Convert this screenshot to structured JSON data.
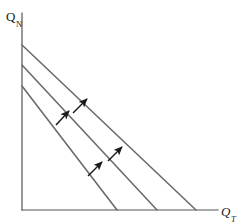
{
  "figure": {
    "title": "",
    "background_color": "#ffffff",
    "width": 242,
    "height": 224
  },
  "axes": {
    "y": {
      "label_base": "Q",
      "label_sub": "N",
      "name": "y-axis-label",
      "color": "#555555",
      "x": 22,
      "top": 13,
      "bottom": 210
    },
    "x": {
      "label_base": "Q",
      "label_sub": "T",
      "name": "x-axis-label",
      "color": "#555555",
      "y": 210,
      "left": 22,
      "right": 218
    }
  },
  "chart_data": {
    "type": "line",
    "title": "",
    "xlabel": "Q_T",
    "ylabel": "Q_N",
    "grid": false,
    "legend": null,
    "line_color": "#6b6b6b",
    "arrow_color": "#1a1a1a",
    "series": [
      {
        "name": "constraint-1",
        "points": [
          [
            22,
            86
          ],
          [
            117,
            210
          ]
        ]
      },
      {
        "name": "constraint-2",
        "points": [
          [
            22,
            65
          ],
          [
            157,
            210
          ]
        ]
      },
      {
        "name": "constraint-3",
        "points": [
          [
            22,
            45
          ],
          [
            196,
            210
          ]
        ]
      }
    ],
    "arrows": [
      {
        "name": "shift-arrow-1",
        "from": [
          56,
          125
        ],
        "to": [
          69,
          111
        ]
      },
      {
        "name": "shift-arrow-2",
        "from": [
          73,
          113
        ],
        "to": [
          87,
          99
        ]
      },
      {
        "name": "shift-arrow-3",
        "from": [
          88,
          176
        ],
        "to": [
          102,
          162
        ]
      },
      {
        "name": "shift-arrow-4",
        "from": [
          108,
          161
        ],
        "to": [
          122,
          147
        ]
      }
    ]
  }
}
